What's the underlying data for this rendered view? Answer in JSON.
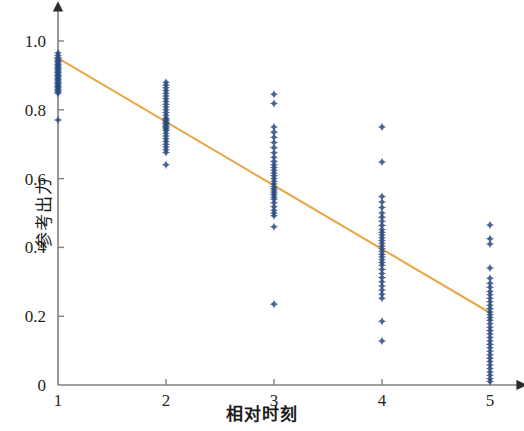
{
  "chart_data": {
    "type": "scatter",
    "title": "",
    "xlabel": "相对时刻",
    "ylabel": "参考出力",
    "xlim": [
      1,
      5.55
    ],
    "ylim": [
      0,
      1.08
    ],
    "xticks": [
      1,
      2,
      3,
      4,
      5
    ],
    "xtick_labels": [
      "1",
      "2",
      "3",
      "4",
      "5"
    ],
    "yticks": [
      0,
      0.2,
      0.4,
      0.6,
      0.8,
      1.0
    ],
    "ytick_labels": [
      "0",
      "0.2",
      "0.4",
      "0.6",
      "0.8",
      "1.0"
    ],
    "grid": false,
    "legend": null,
    "marker": "4-point-star",
    "marker_color": "#2a4a7f",
    "axis_color": "#808080",
    "series": [
      {
        "name": "samples",
        "type": "scatter",
        "points": [
          [
            1,
            0.965
          ],
          [
            1,
            0.958
          ],
          [
            1,
            0.952
          ],
          [
            1,
            0.948
          ],
          [
            1,
            0.944
          ],
          [
            1,
            0.94
          ],
          [
            1,
            0.936
          ],
          [
            1,
            0.932
          ],
          [
            1,
            0.928
          ],
          [
            1,
            0.924
          ],
          [
            1,
            0.92
          ],
          [
            1,
            0.916
          ],
          [
            1,
            0.912
          ],
          [
            1,
            0.908
          ],
          [
            1,
            0.904
          ],
          [
            1,
            0.9
          ],
          [
            1,
            0.896
          ],
          [
            1,
            0.892
          ],
          [
            1,
            0.888
          ],
          [
            1,
            0.884
          ],
          [
            1,
            0.88
          ],
          [
            1,
            0.876
          ],
          [
            1,
            0.872
          ],
          [
            1,
            0.868
          ],
          [
            1,
            0.864
          ],
          [
            1,
            0.86
          ],
          [
            1,
            0.856
          ],
          [
            1,
            0.852
          ],
          [
            1,
            0.848
          ],
          [
            1,
            0.77
          ],
          [
            2,
            0.88
          ],
          [
            2,
            0.872
          ],
          [
            2,
            0.864
          ],
          [
            2,
            0.856
          ],
          [
            2,
            0.848
          ],
          [
            2,
            0.84
          ],
          [
            2,
            0.832
          ],
          [
            2,
            0.824
          ],
          [
            2,
            0.816
          ],
          [
            2,
            0.808
          ],
          [
            2,
            0.8
          ],
          [
            2,
            0.792
          ],
          [
            2,
            0.784
          ],
          [
            2,
            0.776
          ],
          [
            2,
            0.772
          ],
          [
            2,
            0.768
          ],
          [
            2,
            0.764
          ],
          [
            2,
            0.76
          ],
          [
            2,
            0.756
          ],
          [
            2,
            0.752
          ],
          [
            2,
            0.748
          ],
          [
            2,
            0.744
          ],
          [
            2,
            0.74
          ],
          [
            2,
            0.732
          ],
          [
            2,
            0.724
          ],
          [
            2,
            0.716
          ],
          [
            2,
            0.708
          ],
          [
            2,
            0.7
          ],
          [
            2,
            0.692
          ],
          [
            2,
            0.684
          ],
          [
            2,
            0.676
          ],
          [
            2,
            0.64
          ],
          [
            3,
            0.845
          ],
          [
            3,
            0.818
          ],
          [
            3,
            0.75
          ],
          [
            3,
            0.735
          ],
          [
            3,
            0.72
          ],
          [
            3,
            0.705
          ],
          [
            3,
            0.69
          ],
          [
            3,
            0.675
          ],
          [
            3,
            0.662
          ],
          [
            3,
            0.65
          ],
          [
            3,
            0.64
          ],
          [
            3,
            0.632
          ],
          [
            3,
            0.624
          ],
          [
            3,
            0.616
          ],
          [
            3,
            0.608
          ],
          [
            3,
            0.6
          ],
          [
            3,
            0.592
          ],
          [
            3,
            0.584
          ],
          [
            3,
            0.576
          ],
          [
            3,
            0.57
          ],
          [
            3,
            0.564
          ],
          [
            3,
            0.558
          ],
          [
            3,
            0.552
          ],
          [
            3,
            0.546
          ],
          [
            3,
            0.54
          ],
          [
            3,
            0.53
          ],
          [
            3,
            0.518
          ],
          [
            3,
            0.508
          ],
          [
            3,
            0.5
          ],
          [
            3,
            0.492
          ],
          [
            3,
            0.46
          ],
          [
            3,
            0.235
          ],
          [
            4,
            0.75
          ],
          [
            4,
            0.648
          ],
          [
            4,
            0.548
          ],
          [
            4,
            0.532
          ],
          [
            4,
            0.516
          ],
          [
            4,
            0.5
          ],
          [
            4,
            0.488
          ],
          [
            4,
            0.476
          ],
          [
            4,
            0.464
          ],
          [
            4,
            0.452
          ],
          [
            4,
            0.444
          ],
          [
            4,
            0.436
          ],
          [
            4,
            0.428
          ],
          [
            4,
            0.42
          ],
          [
            4,
            0.412
          ],
          [
            4,
            0.404
          ],
          [
            4,
            0.396
          ],
          [
            4,
            0.388
          ],
          [
            4,
            0.38
          ],
          [
            4,
            0.372
          ],
          [
            4,
            0.364
          ],
          [
            4,
            0.356
          ],
          [
            4,
            0.348
          ],
          [
            4,
            0.336
          ],
          [
            4,
            0.324
          ],
          [
            4,
            0.312
          ],
          [
            4,
            0.3
          ],
          [
            4,
            0.288
          ],
          [
            4,
            0.276
          ],
          [
            4,
            0.264
          ],
          [
            4,
            0.252
          ],
          [
            4,
            0.185
          ],
          [
            4,
            0.128
          ],
          [
            5,
            0.465
          ],
          [
            5,
            0.425
          ],
          [
            5,
            0.41
          ],
          [
            5,
            0.34
          ],
          [
            5,
            0.31
          ],
          [
            5,
            0.296
          ],
          [
            5,
            0.284
          ],
          [
            5,
            0.272
          ],
          [
            5,
            0.262
          ],
          [
            5,
            0.252
          ],
          [
            5,
            0.242
          ],
          [
            5,
            0.232
          ],
          [
            5,
            0.222
          ],
          [
            5,
            0.212
          ],
          [
            5,
            0.204
          ],
          [
            5,
            0.196
          ],
          [
            5,
            0.188
          ],
          [
            5,
            0.178
          ],
          [
            5,
            0.168
          ],
          [
            5,
            0.158
          ],
          [
            5,
            0.148
          ],
          [
            5,
            0.138
          ],
          [
            5,
            0.128
          ],
          [
            5,
            0.118
          ],
          [
            5,
            0.108
          ],
          [
            5,
            0.098
          ],
          [
            5,
            0.088
          ],
          [
            5,
            0.078
          ],
          [
            5,
            0.068
          ],
          [
            5,
            0.058
          ],
          [
            5,
            0.048
          ],
          [
            5,
            0.038
          ],
          [
            5,
            0.028
          ],
          [
            5,
            0.018
          ],
          [
            5,
            0.01
          ]
        ]
      }
    ],
    "trendline": {
      "name": "linear-fit",
      "color": "#e8a845",
      "x_start": 1,
      "y_start": 0.95,
      "x_end": 5,
      "y_end": 0.21
    }
  }
}
